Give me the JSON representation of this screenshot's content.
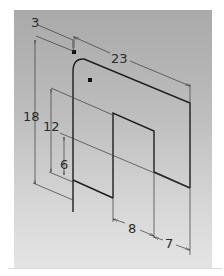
{
  "drawing": {
    "type": "isometric dimensioned plate",
    "colors": {
      "panel_top": "#a9a9a9",
      "panel_bottom": "#e4e4e4",
      "edge": "#1e1e1e",
      "dimension_line": "#3a3a3a",
      "text": "#2a2a2a"
    },
    "dimensions": {
      "corner_radius": "3",
      "width_top": "23",
      "height_total": "18",
      "height_mid": "12",
      "height_low": "6",
      "notch_width": "8",
      "right_width": "7"
    }
  }
}
